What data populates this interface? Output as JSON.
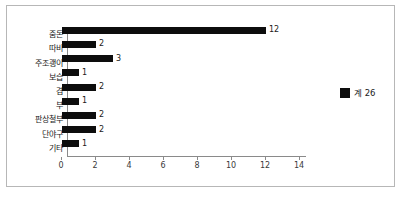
{
  "chart_data": {
    "type": "bar",
    "orientation": "horizontal",
    "title": "",
    "xlabel": "",
    "ylabel": "",
    "categories": [
      "줌돈",
      "따비",
      "주조괭이",
      "보습",
      "겸",
      "부",
      "판상철부",
      "단야구",
      "기타"
    ],
    "values": [
      12,
      2,
      3,
      1,
      2,
      1,
      2,
      2,
      1
    ],
    "data_labels": [
      "12",
      "2",
      "3",
      "1",
      "2",
      "1",
      "2",
      "2",
      "1"
    ],
    "xlim": [
      0,
      14
    ],
    "xticks": [
      0,
      2,
      4,
      6,
      8,
      10,
      12,
      14
    ],
    "xtick_labels": [
      "0",
      "2",
      "4",
      "6",
      "8",
      "10",
      "12",
      "14"
    ],
    "grid": false,
    "legend": {
      "position": "right",
      "entries": [
        {
          "label": "계 26",
          "color": "#0d0d0d"
        }
      ]
    },
    "series": [
      {
        "name": "계 26",
        "color": "#0d0d0d",
        "values": [
          12,
          2,
          3,
          1,
          2,
          1,
          2,
          2,
          1
        ]
      }
    ],
    "total": 26,
    "colors": {
      "bar": "#0d0d0d",
      "axis": "#8a8a8a",
      "frame": "#b7b7b7",
      "background": "#ffffff",
      "text": "#1a1a1a"
    }
  }
}
